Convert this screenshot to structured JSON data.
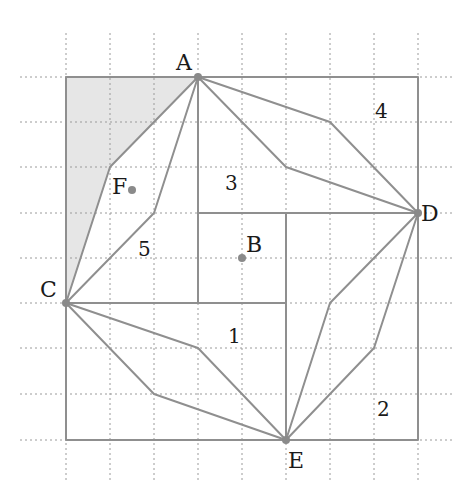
{
  "diagram": {
    "colors": {
      "line": "#8f8f8f",
      "grid": "#9a9a9a",
      "shade": "#e6e6e6",
      "point": "#8a8a8a",
      "text": "#1a1a1a"
    },
    "points": {
      "A": {
        "label": "A"
      },
      "B": {
        "label": "B"
      },
      "C": {
        "label": "C"
      },
      "D": {
        "label": "D"
      },
      "E": {
        "label": "E"
      },
      "F": {
        "label": "F"
      }
    },
    "regions": {
      "r1": "1",
      "r2": "2",
      "r3": "3",
      "r4": "4",
      "r5": "5"
    }
  }
}
